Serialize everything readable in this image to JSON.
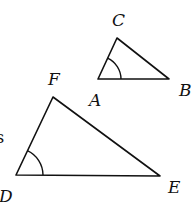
{
  "diagram": {
    "stroke_color": "#111111",
    "background": "#ffffff",
    "triangles": [
      {
        "name": "ABC",
        "vertices": {
          "A": {
            "label": "A",
            "x": 98,
            "y": 79
          },
          "B": {
            "label": "B",
            "x": 169,
            "y": 79
          },
          "C": {
            "label": "C",
            "x": 117,
            "y": 38
          }
        },
        "marked_angle": "A"
      },
      {
        "name": "DEF",
        "vertices": {
          "D": {
            "label": "D",
            "x": 16,
            "y": 175
          },
          "E": {
            "label": "E",
            "x": 160,
            "y": 176
          },
          "F": {
            "label": "F",
            "x": 53,
            "y": 97
          }
        },
        "marked_angle": "D"
      }
    ],
    "labels": {
      "A": "A",
      "B": "B",
      "C": "C",
      "D": "D",
      "E": "E",
      "F": "F"
    },
    "edge_fragment_text": "s"
  }
}
